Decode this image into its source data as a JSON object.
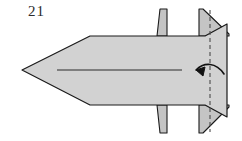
{
  "figure": {
    "step_number": "21",
    "type": "origami-fold-diagram",
    "width": 242,
    "height": 141,
    "background_color": "#ffffff"
  },
  "colors": {
    "paper_fill": "#d2d2d2",
    "paper_fill_shade": "#c4c4c4",
    "outline": "#1a1a1a",
    "center_line": "#2b2b2b",
    "fold_line": "#4a4a4a",
    "arrow": "#111111",
    "label_text": "#2b2b2b"
  },
  "shapes": {
    "body": {
      "name": "main-body",
      "description": "Gray dart-shaped body with pointed left tip and angled right edge",
      "points": "22,70 90,36 205,36 227,24 227,117 205,105 90,105"
    },
    "fin_top_left": {
      "name": "fin-top-left",
      "description": "Narrow upper-left fin rising above the body",
      "points": "157,36 160,9 167,9 167,36"
    },
    "fin_top_right": {
      "name": "fin-top-right",
      "description": "Triangular upper-right fin rising above the body",
      "points": "199,36 199,9 203,9 229,34 229,36"
    },
    "fin_bottom_left": {
      "name": "fin-bottom-left",
      "description": "Narrow lower-left fin below the body",
      "points": "157,105 160,133 167,133 167,105"
    },
    "fin_bottom_right": {
      "name": "fin-bottom-right",
      "description": "Triangular lower-right fin below the body",
      "points": "199,105 199,133 203,133 229,107 229,105"
    }
  },
  "lines": {
    "center_line": {
      "name": "center-axis-line",
      "description": "Horizontal center axis of the body",
      "x1": 57,
      "y1": 70,
      "x2": 182,
      "y2": 70
    },
    "fold_line": {
      "name": "vertical-fold-line",
      "description": "Vertical dashed valley-fold line near the right edge",
      "x1": 210,
      "y1": 10,
      "x2": 210,
      "y2": 132,
      "dash": "4 3"
    }
  },
  "arrow": {
    "name": "fold-direction-arrow",
    "description": "Curved arrow pointing left, indicating fold direction",
    "path": "M 224 74 C 216 62 204 62 196 70",
    "head": "196,70 205,67 203,76",
    "direction": "left"
  }
}
